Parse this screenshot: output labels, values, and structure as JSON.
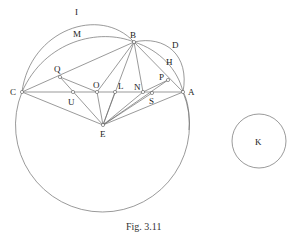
{
  "figure": {
    "caption": "Fig. 3.11",
    "line_color": "#6e6e6e",
    "labels": {
      "I": "I",
      "M": "M",
      "B": "B",
      "D": "D",
      "H": "H",
      "Q": "Q",
      "C": "C",
      "U": "U",
      "O": "O",
      "L": "L",
      "N": "N",
      "P": "P",
      "S": "S",
      "A": "A",
      "E": "E",
      "K": "K"
    },
    "points": {
      "C": [
        22,
        92
      ],
      "B": [
        134,
        42
      ],
      "A": [
        183,
        92
      ],
      "E": [
        103,
        125
      ],
      "Q": [
        60,
        77
      ],
      "U": [
        73,
        92
      ],
      "O": [
        97,
        92
      ],
      "L": [
        115,
        92
      ],
      "N": [
        143,
        92
      ],
      "S": [
        152,
        93
      ],
      "P": [
        168,
        80
      ]
    },
    "circles": {
      "large": {
        "center": [
          102,
          125
        ],
        "radius": 87
      },
      "K": {
        "center": [
          259,
          141
        ],
        "radius": 27
      }
    }
  }
}
